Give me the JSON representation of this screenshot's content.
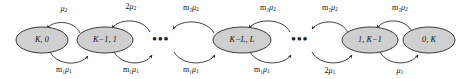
{
  "figure": {
    "type": "markov-chain-state-diagram",
    "background_color": "#ffffff",
    "node_fill_color": "#cfcfcf",
    "node_stroke_color": "#3a3a3a",
    "edge_color": "#2b2b2b",
    "text_color": "#101010"
  },
  "nodes": [
    {
      "id": "n0",
      "label": "K, 0",
      "cx": 42,
      "cy": 40,
      "rx": 26,
      "ry": 13
    },
    {
      "id": "n1",
      "label": "K−1, 1",
      "cx": 105,
      "cy": 40,
      "rx": 28,
      "ry": 13
    },
    {
      "id": "n2",
      "label": "K−L, L",
      "cx": 242,
      "cy": 40,
      "rx": 29,
      "ry": 13
    },
    {
      "id": "n3",
      "label": "1, K−1",
      "cx": 370,
      "cy": 40,
      "rx": 28,
      "ry": 13
    },
    {
      "id": "n4",
      "label": "0, K",
      "cx": 429,
      "cy": 40,
      "rx": 26,
      "ry": 13
    }
  ],
  "ellipses_gaps": [
    {
      "id": "gap1",
      "text": "•••",
      "cx": 161,
      "cy": 40
    },
    {
      "id": "gap2",
      "text": "•••",
      "cx": 300,
      "cy": 40
    }
  ],
  "edges_top": [
    {
      "id": "t0",
      "from": "n1",
      "to": "n0",
      "base": "μ",
      "sub": "2",
      "prefix": "",
      "label_x": 64,
      "label_y": 9,
      "path": "M 80 33 C 74 20, 54 20, 47 28"
    },
    {
      "id": "t1",
      "from": "gap1",
      "to": "n1",
      "base": "μ",
      "sub": "2",
      "prefix": "2",
      "label_x": 131,
      "label_y": 7,
      "path": "M 150 32 C 143 18, 120 18, 112 28"
    },
    {
      "id": "t2",
      "from": "n2",
      "to": "gap1",
      "base": "μ",
      "sub": "2",
      "prefix": "m₂",
      "label_x": 191,
      "label_y": 8,
      "path": "M 214 33 C 206 19, 181 19, 173 29"
    },
    {
      "id": "t3",
      "from": "gap2",
      "to": "n2",
      "base": "μ",
      "sub": "2",
      "prefix": "m₂",
      "label_x": 268,
      "label_y": 8,
      "path": "M 290 32 C 283 18, 257 18, 249 28"
    },
    {
      "id": "t4",
      "from": "n3",
      "to": "gap2",
      "base": "μ",
      "sub": "2",
      "prefix": "m₂",
      "label_x": 330,
      "label_y": 8,
      "path": "M 348 33 C 342 19, 320 19, 312 29"
    },
    {
      "id": "t5",
      "from": "n4",
      "to": "n3",
      "base": "μ",
      "sub": "2",
      "prefix": "m₂",
      "label_x": 400,
      "label_y": 8,
      "path": "M 412 32 C 406 18, 384 18, 377 28"
    }
  ],
  "edges_bottom": [
    {
      "id": "b0",
      "from": "n0",
      "to": "n1",
      "base": "μ",
      "sub": "1",
      "prefix": "m₁",
      "label_x": 64,
      "label_y": 70,
      "path": "M 50 52 C 58 66, 80 66, 88 56"
    },
    {
      "id": "b1",
      "from": "n1",
      "to": "gap1",
      "base": "μ",
      "sub": "1",
      "prefix": "m₁",
      "label_x": 131,
      "label_y": 70,
      "path": "M 114 52 C 122 66, 145 66, 152 55"
    },
    {
      "id": "b2",
      "from": "gap1",
      "to": "n2",
      "base": "μ",
      "sub": "1",
      "prefix": "m₁",
      "label_x": 191,
      "label_y": 70,
      "path": "M 174 52 C 182 66, 207 66, 215 55"
    },
    {
      "id": "b3",
      "from": "n2",
      "to": "gap2",
      "base": "μ",
      "sub": "1",
      "prefix": "m₁",
      "label_x": 262,
      "label_y": 70,
      "path": "M 250 52 C 258 66, 283 66, 291 55"
    },
    {
      "id": "b4",
      "from": "gap2",
      "to": "n3",
      "base": "μ",
      "sub": "1",
      "prefix": "2",
      "label_x": 330,
      "label_y": 71,
      "path": "M 312 52 C 320 66, 344 66, 352 55"
    },
    {
      "id": "b5",
      "from": "n3",
      "to": "n4",
      "base": "μ",
      "sub": "1",
      "prefix": "",
      "label_x": 400,
      "label_y": 71,
      "path": "M 380 52 C 388 66, 410 66, 418 55"
    }
  ]
}
